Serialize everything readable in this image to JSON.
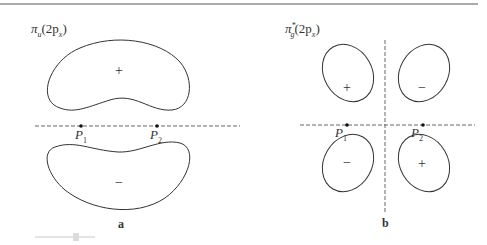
{
  "panels": [
    {
      "id": "a",
      "title": {
        "symbol": "π",
        "sub": "u",
        "orbital": "(2p",
        "orbital_sub": "x",
        "close": ")"
      },
      "label": "a",
      "points": [
        {
          "name": "P",
          "sub": "1"
        },
        {
          "name": "P",
          "sub": "2"
        }
      ],
      "lobes": [
        {
          "sign": "+"
        },
        {
          "sign": "−"
        }
      ]
    },
    {
      "id": "b",
      "title": {
        "symbol": "π",
        "sub": "g",
        "sup": "*",
        "orbital": "(2p",
        "orbital_sub": "x",
        "close": ")"
      },
      "label": "b",
      "points": [
        {
          "name": "P",
          "sub": "1"
        },
        {
          "name": "P",
          "sub": "2"
        }
      ],
      "lobes": [
        {
          "sign": "+"
        },
        {
          "sign": "−"
        },
        {
          "sign": "−"
        },
        {
          "sign": "+"
        }
      ]
    }
  ],
  "colors": {
    "stroke": "#333333",
    "dashed": "#666666",
    "topline": "#aaaaaa"
  }
}
